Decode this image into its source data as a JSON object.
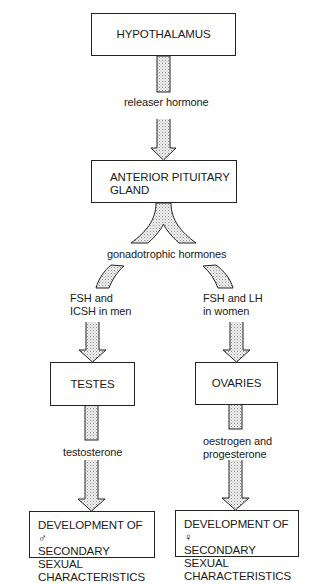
{
  "diagram": {
    "nodes": {
      "hypothalamus": {
        "label": "HYPOTHALAMUS"
      },
      "anterior_pituitary": {
        "lines": [
          "ANTERIOR PITUITARY",
          "GLAND"
        ]
      },
      "testes": {
        "label": "TESTES"
      },
      "ovaries": {
        "label": "OVARIES"
      },
      "male_development": {
        "lines": [
          "DEVELOPMENT OF ♂",
          "SECONDARY SEXUAL",
          "CHARACTERISTICS"
        ]
      },
      "female_development": {
        "lines": [
          "DEVELOPMENT OF ♀",
          "SECONDARY SEXUAL",
          "CHARACTERISTICS"
        ]
      }
    },
    "edges": {
      "releaser": {
        "label": "releaser hormone",
        "from": "hypothalamus",
        "to": "anterior_pituitary"
      },
      "gonadotrophic": {
        "label": "gonadotrophic hormones",
        "from": "anterior_pituitary",
        "to": [
          "testes",
          "ovaries"
        ]
      },
      "men_branch": {
        "lines": [
          "FSH and",
          "ICSH in men"
        ],
        "to": "testes"
      },
      "women_branch": {
        "lines": [
          "FSH and LH",
          "in women"
        ],
        "to": "ovaries"
      },
      "testosterone": {
        "label": "testosterone",
        "from": "testes",
        "to": "male_development"
      },
      "female_hormones": {
        "lines": [
          "oestrogen and",
          "progesterone"
        ],
        "from": "ovaries",
        "to": "female_development"
      }
    },
    "style": {
      "stroke": "#222222",
      "arrow_fill": "stippled grey",
      "background": "#ffffff"
    }
  }
}
